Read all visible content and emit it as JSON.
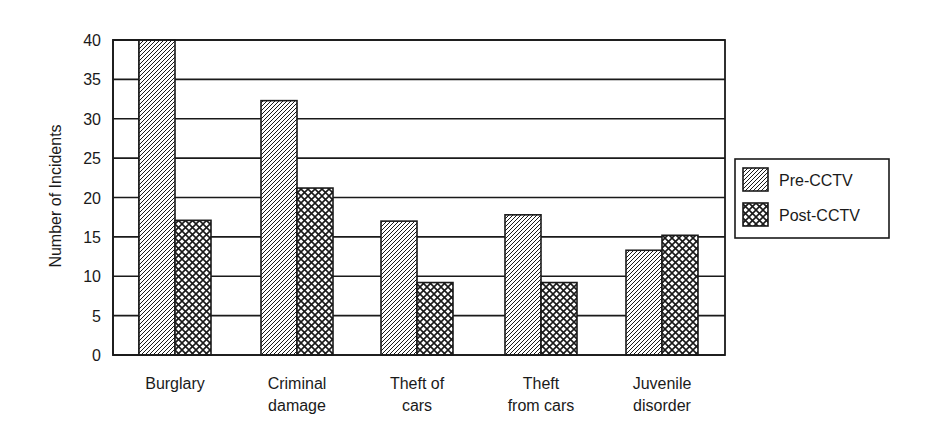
{
  "chart_data": {
    "type": "bar",
    "title": "",
    "xlabel": "",
    "ylabel": "Number of Incidents",
    "ylim": [
      0,
      40
    ],
    "yticks": [
      0,
      5,
      10,
      15,
      20,
      25,
      30,
      35,
      40
    ],
    "grid": true,
    "legend_position": "right",
    "categories": [
      [
        "Burglary"
      ],
      [
        "Criminal",
        "damage"
      ],
      [
        "Theft of",
        "cars"
      ],
      [
        "Theft",
        "from cars"
      ],
      [
        "Juvenile",
        "disorder"
      ]
    ],
    "series": [
      {
        "name": "Pre-CCTV",
        "pattern": "diagonal-hatch",
        "values": [
          40,
          32.3,
          17,
          17.8,
          13.3
        ]
      },
      {
        "name": "Post-CCTV",
        "pattern": "crosshatch",
        "values": [
          17.1,
          21.2,
          9.2,
          9.2,
          15.2
        ]
      }
    ]
  },
  "colors": {
    "ink": "#1a1a1a",
    "background": "#ffffff"
  }
}
